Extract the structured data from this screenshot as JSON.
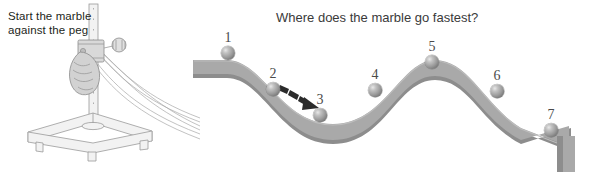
{
  "figure": {
    "instruction_text": "Start the marble against the peg",
    "question_text": "Where does the marble go fastest?",
    "background_color": "#ffffff",
    "track_color": "#a9a9a9",
    "track_edge_color": "#8d8d8d",
    "marble_color": "#9a9a9a",
    "label_color": "#4a4a4a",
    "arrow_color": "#2b2b2b"
  },
  "apparatus": {
    "name": "ramp-stand-apparatus",
    "parts": [
      "triangular-base",
      "vertical-rod",
      "clamp-block",
      "thumb-screw-knob",
      "hand-holding-marble",
      "track-rails"
    ]
  },
  "marbles": [
    {
      "label": "1",
      "cx": 228,
      "cy": 53,
      "r": 7.0,
      "label_x": 228,
      "label_y": 30
    },
    {
      "label": "2",
      "cx": 273,
      "cy": 89,
      "r": 6.8,
      "label_x": 273,
      "label_y": 66
    },
    {
      "label": "3",
      "cx": 320,
      "cy": 115,
      "r": 6.8,
      "label_x": 320,
      "label_y": 92
    },
    {
      "label": "4",
      "cx": 375,
      "cy": 90,
      "r": 6.8,
      "label_x": 375,
      "label_y": 67
    },
    {
      "label": "5",
      "cx": 432,
      "cy": 62,
      "r": 7.0,
      "label_x": 432,
      "label_y": 39
    },
    {
      "label": "6",
      "cx": 497,
      "cy": 91,
      "r": 6.8,
      "label_x": 497,
      "label_y": 68
    },
    {
      "label": "7",
      "cx": 551,
      "cy": 130,
      "r": 6.8,
      "label_x": 551,
      "label_y": 107
    }
  ],
  "arrow": {
    "name": "motion-arrow",
    "from_x": 283,
    "from_y": 88,
    "to_x": 312,
    "to_y": 108,
    "segments": 3
  },
  "track": {
    "start_x": 195,
    "start_y": 60,
    "valley_x": 330,
    "valley_y": 123,
    "crest_x": 432,
    "crest_y": 68,
    "end_x": 568,
    "end_y": 136,
    "thickness": 12,
    "end_stop": true
  }
}
